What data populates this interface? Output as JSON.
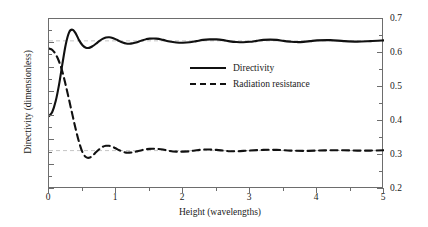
{
  "chart_data": {
    "type": "line",
    "title": "",
    "xlabel": "Height (wavelengths)",
    "ylabel": "Directivity (dimensionless)",
    "ylabel_right": "Radiation resistance (ohms)",
    "xlim": [
      0,
      5
    ],
    "ylim": [
      0,
      7
    ],
    "ylim_right": [
      0.2,
      0.7
    ],
    "grid": false,
    "legend_position": "upper-center",
    "x_ticks": [
      0,
      1,
      2,
      3,
      4,
      5
    ],
    "x_tick_labels": [
      "0",
      "1",
      "2",
      "3",
      "4",
      "5"
    ],
    "x_minor_ticks": [
      0.5,
      1.5,
      2.5,
      3.5,
      4.5
    ],
    "y_ticks_left": [
      0,
      1,
      2,
      3,
      4,
      5,
      6,
      7
    ],
    "y_tick_labels_left": [
      "0",
      "1",
      "2",
      "3",
      "4",
      "5",
      "6",
      "7"
    ],
    "y_ticks_right": [
      0.2,
      0.3,
      0.4,
      0.5,
      0.6,
      0.7
    ],
    "y_tick_labels_right": [
      "0.2",
      "0.3",
      "0.4",
      "0.5",
      "0.6",
      "0.7"
    ],
    "y_minor_ticks_right": [
      0.25,
      0.35,
      0.45,
      0.55,
      0.65
    ],
    "reference_lines": [
      {
        "name": "directivity-asymptote",
        "axis": "left",
        "value": 6.1,
        "style": "dashed",
        "color": "#b8b8b8"
      },
      {
        "name": "resistance-asymptote",
        "axis": "right",
        "value": 0.313,
        "style": "dashed",
        "color": "#b8b8b8"
      }
    ],
    "series": [
      {
        "name": "Directivity",
        "axis": "left",
        "style": "solid",
        "color": "#111111",
        "x": [
          0.0,
          0.05,
          0.1,
          0.15,
          0.2,
          0.25,
          0.3,
          0.35,
          0.4,
          0.45,
          0.5,
          0.55,
          0.6,
          0.65,
          0.7,
          0.75,
          0.8,
          0.85,
          0.9,
          0.95,
          1.0,
          1.05,
          1.1,
          1.15,
          1.2,
          1.25,
          1.3,
          1.35,
          1.4,
          1.45,
          1.5,
          1.6,
          1.7,
          1.8,
          1.9,
          2.0,
          2.1,
          2.2,
          2.3,
          2.4,
          2.5,
          2.6,
          2.7,
          2.8,
          2.9,
          3.0,
          3.1,
          3.2,
          3.3,
          3.4,
          3.5,
          3.6,
          3.7,
          3.8,
          3.9,
          4.0,
          4.2,
          4.4,
          4.6,
          4.8,
          5.0
        ],
        "y": [
          3.0,
          3.18,
          3.62,
          4.3,
          5.15,
          5.95,
          6.45,
          6.56,
          6.4,
          6.12,
          5.92,
          5.82,
          5.81,
          5.88,
          5.98,
          6.09,
          6.18,
          6.24,
          6.25,
          6.22,
          6.16,
          6.09,
          6.03,
          5.99,
          5.98,
          6.0,
          6.03,
          6.08,
          6.13,
          6.17,
          6.19,
          6.19,
          6.14,
          6.07,
          6.03,
          6.02,
          6.04,
          6.09,
          6.14,
          6.16,
          6.16,
          6.13,
          6.08,
          6.05,
          6.04,
          6.06,
          6.1,
          6.14,
          6.15,
          6.14,
          6.1,
          6.07,
          6.05,
          6.06,
          6.09,
          6.12,
          6.13,
          6.09,
          6.07,
          6.09,
          6.12
        ]
      },
      {
        "name": "Radiation resistance",
        "axis": "right",
        "style": "dashed",
        "color": "#111111",
        "x": [
          0.0,
          0.05,
          0.1,
          0.15,
          0.2,
          0.25,
          0.3,
          0.35,
          0.4,
          0.45,
          0.5,
          0.55,
          0.6,
          0.65,
          0.7,
          0.75,
          0.8,
          0.85,
          0.9,
          0.95,
          1.0,
          1.05,
          1.1,
          1.15,
          1.2,
          1.25,
          1.3,
          1.4,
          1.5,
          1.6,
          1.7,
          1.8,
          1.9,
          2.0,
          2.1,
          2.2,
          2.3,
          2.4,
          2.5,
          2.6,
          2.7,
          2.8,
          2.9,
          3.0,
          3.2,
          3.4,
          3.6,
          3.8,
          4.0,
          4.2,
          4.4,
          4.6,
          4.8,
          5.0
        ],
        "y": [
          0.613,
          0.609,
          0.596,
          0.575,
          0.545,
          0.505,
          0.462,
          0.418,
          0.375,
          0.337,
          0.308,
          0.294,
          0.292,
          0.298,
          0.308,
          0.317,
          0.324,
          0.327,
          0.327,
          0.324,
          0.319,
          0.314,
          0.31,
          0.307,
          0.307,
          0.308,
          0.31,
          0.315,
          0.318,
          0.318,
          0.316,
          0.312,
          0.31,
          0.31,
          0.311,
          0.314,
          0.316,
          0.316,
          0.315,
          0.313,
          0.311,
          0.311,
          0.312,
          0.313,
          0.315,
          0.315,
          0.313,
          0.312,
          0.313,
          0.314,
          0.314,
          0.313,
          0.313,
          0.314
        ]
      }
    ]
  },
  "legend": {
    "items": [
      {
        "label": "Directivity",
        "style": "solid"
      },
      {
        "label": "Radiation resistance",
        "style": "dashed"
      }
    ]
  }
}
